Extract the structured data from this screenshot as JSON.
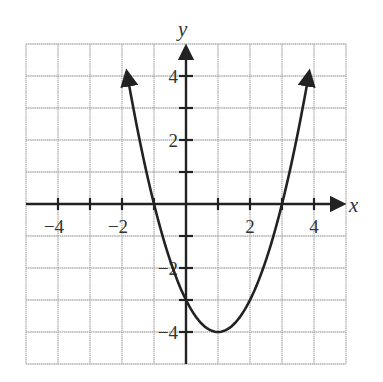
{
  "chart_data": {
    "type": "line",
    "title": "",
    "xlabel": "x",
    "ylabel": "y",
    "xlim": [
      -5,
      5
    ],
    "ylim": [
      -5,
      5
    ],
    "grid": true,
    "x_ticks": [
      -4,
      -3,
      -2,
      -1,
      1,
      2,
      3,
      4
    ],
    "y_ticks": [
      -4,
      -3,
      -2,
      -1,
      1,
      2,
      3,
      4
    ],
    "x_tick_labels": [
      {
        "value": -4,
        "label": "−4"
      },
      {
        "value": -2,
        "label": "−2"
      },
      {
        "value": 2,
        "label": "2"
      },
      {
        "value": 4,
        "label": "4"
      }
    ],
    "y_tick_labels": [
      {
        "value": 4,
        "label": "4"
      },
      {
        "value": 2,
        "label": "2"
      },
      {
        "value": -2,
        "label": "−2"
      },
      {
        "value": -4,
        "label": "−4"
      }
    ],
    "series": [
      {
        "name": "parabola",
        "equation": "y = x^2 - 2x - 3",
        "vertex": [
          1,
          -4
        ],
        "x_intercepts": [
          -1,
          3
        ],
        "y_intercept": -3,
        "x_range": [
          -1.85,
          3.85
        ],
        "points": [
          {
            "x": -1.85,
            "y": 4.12
          },
          {
            "x": -1,
            "y": 0
          },
          {
            "x": 0,
            "y": -3
          },
          {
            "x": 1,
            "y": -4
          },
          {
            "x": 2,
            "y": -3
          },
          {
            "x": 3,
            "y": 0
          },
          {
            "x": 3.85,
            "y": 4.12
          }
        ],
        "arrows_at_ends": true
      }
    ]
  },
  "labels": {
    "x_axis": "x",
    "y_axis": "y"
  },
  "colors": {
    "grid": "#b0b0b0",
    "axis": "#222222",
    "curve": "#222222",
    "background": "#ffffff"
  }
}
